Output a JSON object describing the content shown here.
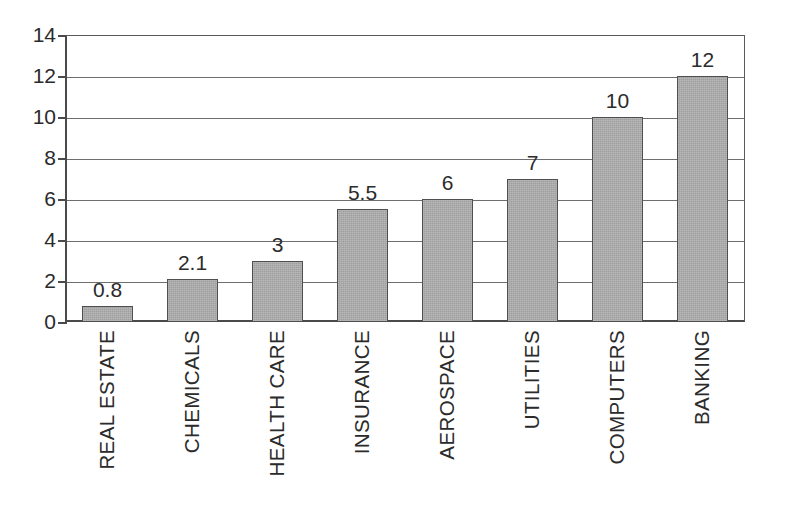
{
  "chart_data": {
    "type": "bar",
    "title": "",
    "subtitle": "",
    "xlabel": "",
    "ylabel": "",
    "categories": [
      "REAL ESTATE",
      "CHEMICALS",
      "HEALTH CARE",
      "INSURANCE",
      "AEROSPACE",
      "UTILITIES",
      "COMPUTERS",
      "BANKING"
    ],
    "values": [
      0.8,
      2.1,
      3,
      5.5,
      6,
      7,
      10,
      12
    ],
    "value_labels": [
      "0.8",
      "2.1",
      "3",
      "5.5",
      "6",
      "7",
      "10",
      "12"
    ],
    "ylim": [
      0,
      14
    ],
    "y_ticks": [
      0,
      2,
      4,
      6,
      8,
      10,
      12,
      14
    ],
    "y_tick_labels": [
      "0",
      "2",
      "4",
      "6",
      "8",
      "10",
      "12",
      "14"
    ],
    "grid": true,
    "grid_axis": "y",
    "legend": false,
    "legend_position": "none",
    "bar_fill_color": "#a9a9a9",
    "bar_border_color": "#4f4f4f",
    "axis_color": "#4a4a4a",
    "grid_color": "#6e6e6e",
    "text_color": "#2b2b2b",
    "background_color": "#ffffff",
    "data_labels_shown": true,
    "category_label_rotation": -90
  }
}
